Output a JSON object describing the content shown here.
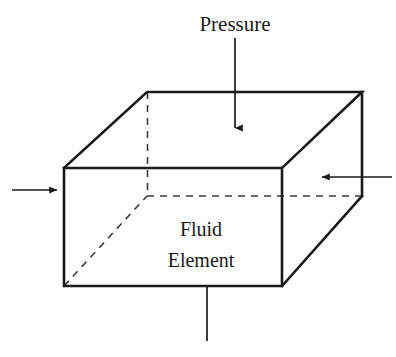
{
  "figure": {
    "background_color": "#ffffff",
    "stroke_color": "#1a1a1a",
    "text_color": "#1a1a1a",
    "width": 396,
    "height": 357
  },
  "labels": {
    "pressure": "Pressure",
    "element_line1": "Fluid",
    "element_line2": "Element"
  },
  "box": {
    "description": "Rectangular cuboid drawn in oblique projection; visible edges solid, hidden edges dashed",
    "front_face": {
      "top_left": [
        64,
        168
      ],
      "top_right": [
        282,
        168
      ],
      "bottom_right": [
        282,
        286
      ],
      "bottom_left": [
        64,
        286
      ]
    },
    "back_face": {
      "top_left": [
        147,
        92
      ],
      "top_right": [
        362,
        92
      ],
      "bottom_right": [
        362,
        196
      ],
      "bottom_left": [
        147,
        196
      ]
    },
    "hidden_edges": [
      "back-left vertical",
      "back-bottom horizontal",
      "bottom-left receding"
    ]
  },
  "arrows": [
    {
      "name": "top-pressure-arrow",
      "direction": "down",
      "from": [
        235,
        38
      ],
      "to": [
        235,
        135
      ],
      "has_head": true
    },
    {
      "name": "left-pressure-arrow",
      "direction": "right",
      "from": [
        12,
        190
      ],
      "to": [
        64,
        190
      ],
      "has_head": true
    },
    {
      "name": "right-pressure-arrow",
      "direction": "left",
      "from": [
        392,
        177
      ],
      "to": [
        315,
        177
      ],
      "has_head": true
    },
    {
      "name": "bottom-pressure-line",
      "direction": "down",
      "from": [
        207,
        286
      ],
      "to": [
        207,
        340
      ],
      "has_head": false
    }
  ]
}
